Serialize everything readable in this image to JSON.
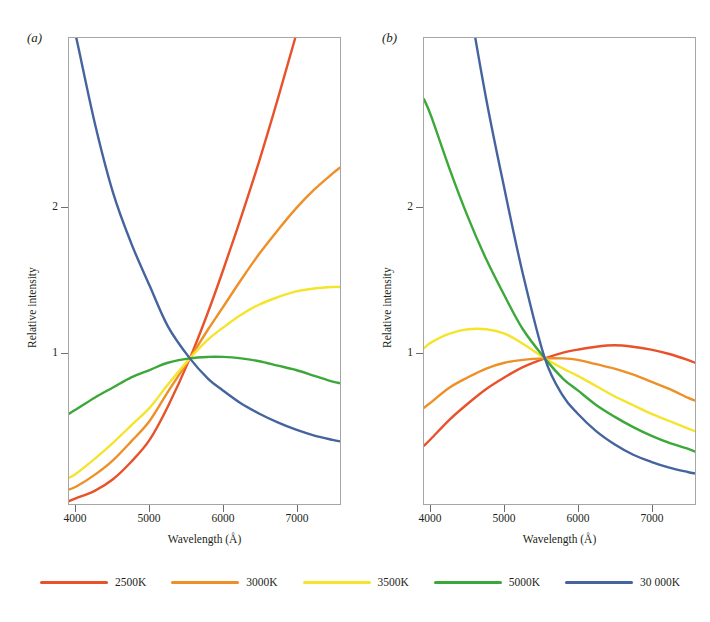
{
  "figure": {
    "background": "#ffffff",
    "panels": [
      {
        "id": "a",
        "label": "(a)",
        "xlabel": "Wavelength (Å)",
        "ylabel": "Relative intensity",
        "xticks": [
          "4000",
          "5000",
          "6000",
          "7000"
        ],
        "yticks": [
          "1",
          "2"
        ]
      },
      {
        "id": "b",
        "label": "(b)",
        "xlabel": "Wavelength (Å)",
        "ylabel": "Relative intensity",
        "xticks": [
          "4000",
          "5000",
          "6000",
          "7000"
        ],
        "yticks": [
          "1",
          "2"
        ]
      }
    ]
  },
  "legend": {
    "items": [
      {
        "label": "2500K",
        "color": "#e8522a"
      },
      {
        "label": "3000K",
        "color": "#ee8f27"
      },
      {
        "label": "3500K",
        "color": "#f5e42c"
      },
      {
        "label": "5000K",
        "color": "#3da83a"
      },
      {
        "label": "30 000K",
        "color": "#45649f"
      }
    ]
  },
  "chart_data": {
    "type": "line",
    "title": "",
    "panels": [
      {
        "id": "a",
        "label": "(a)",
        "title": "",
        "xlabel": "Wavelength (Å)",
        "ylabel": "Relative intensity",
        "xlim": [
          3900,
          7600
        ],
        "ylim": [
          0.0,
          3.2
        ],
        "xticks": [
          4000,
          5000,
          6000,
          7000
        ],
        "yticks": [
          1,
          2
        ],
        "grid": false,
        "normalization_point": {
          "x": 5550,
          "y": 1.0
        },
        "x": [
          3900,
          4000,
          4250,
          4500,
          4750,
          5000,
          5250,
          5550,
          5800,
          6000,
          6250,
          6500,
          6750,
          7000,
          7250,
          7500,
          7600
        ],
        "series": [
          {
            "name": "2500K",
            "color": "#e8522a",
            "values": [
              0.02,
              0.04,
              0.09,
              0.17,
              0.29,
              0.44,
              0.67,
              1.0,
              1.32,
              1.6,
              1.97,
              2.36,
              2.78,
              3.22,
              3.68,
              4.16,
              4.36
            ]
          },
          {
            "name": "3000K",
            "color": "#ee8f27",
            "values": [
              0.1,
              0.12,
              0.2,
              0.3,
              0.43,
              0.57,
              0.77,
              1.0,
              1.2,
              1.35,
              1.54,
              1.72,
              1.88,
              2.03,
              2.16,
              2.27,
              2.31
            ]
          },
          {
            "name": "3500K",
            "color": "#f5e42c",
            "values": [
              0.18,
              0.21,
              0.31,
              0.42,
              0.54,
              0.66,
              0.82,
              1.0,
              1.13,
              1.21,
              1.3,
              1.37,
              1.42,
              1.46,
              1.48,
              1.49,
              1.49
            ]
          },
          {
            "name": "5000K",
            "color": "#3da83a",
            "values": [
              0.62,
              0.65,
              0.73,
              0.8,
              0.87,
              0.92,
              0.97,
              1.0,
              1.01,
              1.01,
              1.0,
              0.98,
              0.95,
              0.92,
              0.88,
              0.84,
              0.83
            ]
          },
          {
            "name": "30 000K",
            "color": "#45649f",
            "values": [
              3.4,
              3.2,
              2.62,
              2.14,
              1.79,
              1.5,
              1.22,
              1.0,
              0.86,
              0.78,
              0.69,
              0.62,
              0.56,
              0.51,
              0.47,
              0.44,
              0.43
            ]
          }
        ]
      },
      {
        "id": "b",
        "label": "(b)",
        "title": "",
        "xlabel": "Wavelength (Å)",
        "ylabel": "Relative intensity",
        "xlim": [
          3900,
          7600
        ],
        "ylim": [
          0.0,
          3.2
        ],
        "xticks": [
          4000,
          5000,
          6000,
          7000
        ],
        "yticks": [
          1,
          2
        ],
        "grid": false,
        "normalization_point": {
          "x": 5550,
          "y": 1.0
        },
        "x": [
          3900,
          4000,
          4250,
          4500,
          4750,
          5000,
          5250,
          5550,
          5800,
          6000,
          6250,
          6500,
          6750,
          7000,
          7250,
          7500,
          7600
        ],
        "series": [
          {
            "name": "2500K",
            "color": "#e8522a",
            "values": [
              0.4,
              0.45,
              0.58,
              0.69,
              0.79,
              0.87,
              0.94,
              1.0,
              1.04,
              1.06,
              1.08,
              1.09,
              1.08,
              1.06,
              1.03,
              0.99,
              0.97
            ]
          },
          {
            "name": "3000K",
            "color": "#ee8f27",
            "values": [
              0.66,
              0.7,
              0.8,
              0.87,
              0.93,
              0.97,
              0.99,
              1.0,
              1.0,
              0.99,
              0.96,
              0.93,
              0.89,
              0.84,
              0.79,
              0.73,
              0.71
            ]
          },
          {
            "name": "3500K",
            "color": "#f5e42c",
            "values": [
              1.07,
              1.11,
              1.17,
              1.2,
              1.2,
              1.17,
              1.1,
              1.0,
              0.93,
              0.88,
              0.81,
              0.74,
              0.68,
              0.62,
              0.57,
              0.52,
              0.5
            ]
          },
          {
            "name": "5000K",
            "color": "#3da83a",
            "values": [
              2.78,
              2.66,
              2.3,
              1.97,
              1.68,
              1.43,
              1.2,
              1.0,
              0.86,
              0.78,
              0.68,
              0.6,
              0.53,
              0.47,
              0.42,
              0.38,
              0.36
            ]
          },
          {
            "name": "30 000K",
            "color": "#45649f",
            "values": [
              5.7,
              5.3,
              4.3,
              3.5,
              2.78,
              2.16,
              1.58,
              1.0,
              0.74,
              0.62,
              0.5,
              0.41,
              0.34,
              0.29,
              0.25,
              0.22,
              0.21
            ]
          }
        ]
      }
    ]
  }
}
